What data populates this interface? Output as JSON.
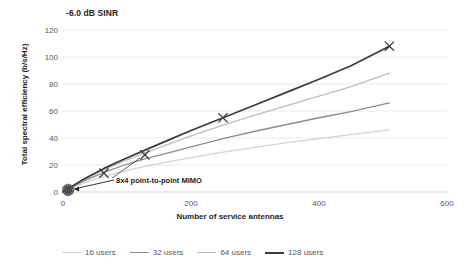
{
  "chart_data": {
    "type": "line",
    "title": "-6.0 dB SINR",
    "subtitle": "",
    "xlabel": "Number of service antennas",
    "ylabel": "Total spectral efficiency (b/s/Hz)",
    "xlim": [
      0,
      600
    ],
    "ylim": [
      0,
      120
    ],
    "xticks": [
      "0",
      "200",
      "400",
      "600"
    ],
    "xtick_values": [
      0,
      200,
      400,
      600
    ],
    "yticks": [
      "0",
      "20",
      "40",
      "60",
      "80",
      "100",
      "120"
    ],
    "ytick_values": [
      0,
      20,
      40,
      60,
      80,
      100,
      120
    ],
    "grid": "horizontal",
    "legend_position": "bottom",
    "series": [
      {
        "name": "16 users",
        "color": "#d2d3d5",
        "x": [
          0,
          32,
          64,
          96,
          128,
          160,
          200,
          250,
          300,
          350,
          400,
          450,
          510
        ],
        "values": [
          0,
          6.5,
          11.5,
          15.5,
          19.0,
          22.0,
          25.5,
          29.5,
          33.0,
          36.5,
          39.5,
          42.5,
          46.0
        ]
      },
      {
        "name": "32 users",
        "color": "#8a8c8e",
        "x": [
          0,
          32,
          64,
          96,
          128,
          160,
          200,
          250,
          300,
          350,
          400,
          450,
          510
        ],
        "values": [
          0,
          8.0,
          14.5,
          20.0,
          24.5,
          28.5,
          33.5,
          39.5,
          45.0,
          50.0,
          55.0,
          59.5,
          66.0
        ]
      },
      {
        "name": "64 users",
        "color": "#bcbec0",
        "x": [
          0,
          32,
          64,
          96,
          128,
          160,
          200,
          250,
          300,
          350,
          400,
          450,
          510
        ],
        "values": [
          0,
          9.0,
          16.5,
          23.0,
          29.0,
          34.5,
          41.5,
          49.5,
          57.0,
          64.0,
          71.0,
          78.0,
          88.0
        ]
      },
      {
        "name": "128 users",
        "color": "#3b3b3d",
        "x": [
          0,
          32,
          64,
          96,
          128,
          160,
          200,
          250,
          300,
          350,
          400,
          450,
          510
        ],
        "values": [
          0,
          9.5,
          17.5,
          24.5,
          31.0,
          37.5,
          45.5,
          55.0,
          64.5,
          74.0,
          83.5,
          93.5,
          108.0
        ]
      }
    ],
    "markers": {
      "symbol": "x",
      "color": "#3b3b3d",
      "points": [
        {
          "x": 64,
          "y": 14.0
        },
        {
          "x": 128,
          "y": 27.5
        },
        {
          "x": 250,
          "y": 55.0
        },
        {
          "x": 510,
          "y": 108.0
        }
      ]
    },
    "annotations": [
      {
        "name": "point-to-point-mimo",
        "text": "8x4 point-to-point MIMO",
        "marker_symbol": "starburst",
        "marker_color": "#4a4a4c",
        "target_x": 8,
        "target_y": 1.5
      }
    ]
  }
}
